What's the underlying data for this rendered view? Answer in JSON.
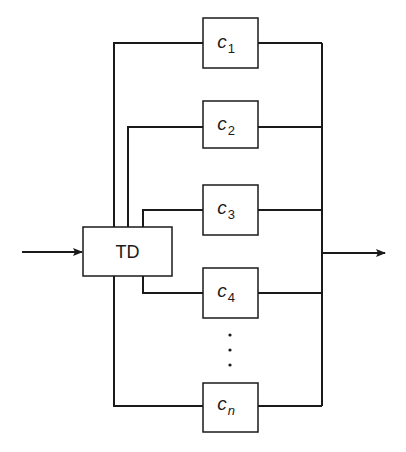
{
  "diagram": {
    "type": "parallel ensemble block diagram",
    "input_arrow": {
      "direction": "right"
    },
    "output_arrow": {
      "direction": "right"
    },
    "splitter": {
      "label": "TD"
    },
    "components": [
      {
        "var": "c",
        "sub": "1"
      },
      {
        "var": "c",
        "sub": "2"
      },
      {
        "var": "c",
        "sub": "3"
      },
      {
        "var": "c",
        "sub": "4"
      },
      {
        "var": "c",
        "sub": "n"
      }
    ],
    "ellipsis": "vertical dots",
    "colors": {
      "stroke": "#1a1a1a",
      "background": "#ffffff"
    }
  }
}
